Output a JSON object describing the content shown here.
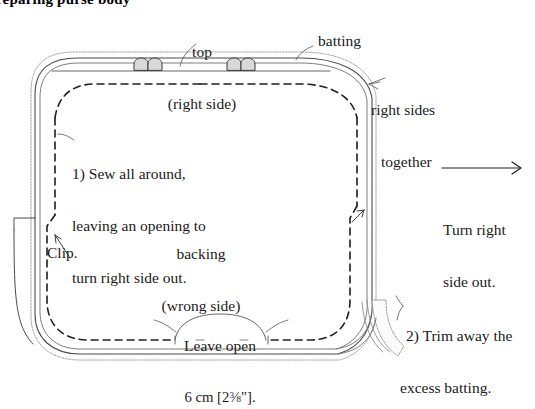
{
  "title": {
    "text": "reparing purse body",
    "note": "cropped heading at top edge"
  },
  "labels": {
    "top_line1": "top",
    "top_line2": "(right side)",
    "batting": "batting",
    "right_sides_1": "right sides",
    "right_sides_2": "together",
    "step1_line1": "1) Sew all around,",
    "step1_line2": "leaving an opening to",
    "step1_line3": "turn right side out.",
    "clip": "Clip.",
    "backing_line1": "backing",
    "backing_line2": "(wrong side)",
    "leave_open": "Leave open",
    "measure_cm": "6 cm [2",
    "measure_num": "3",
    "measure_den": "8",
    "measure_tail": "\"].",
    "turn_line1": "Turn right",
    "turn_line2": "side out.",
    "step2_line1": "2) Trim away the",
    "step2_line2": "excess batting."
  },
  "icons": {
    "arrow": "turn-arrow-icon",
    "leader": "leader-line-icon",
    "tab": "tab-loop-icon",
    "batting_edge": "wavy-batting-edge-icon",
    "stitch": "dashed-stitch-line-icon",
    "bracket": "opening-bracket-icon"
  },
  "colors": {
    "ink": "#1a1a1a",
    "line": "#3a3a3a",
    "light_line": "#8e8e8e",
    "batting": "#a8a8a8",
    "paper": "#ffffff"
  },
  "diagram": {
    "type": "sewing-instruction-line-drawing",
    "shape": "rounded-rectangle-purse-body",
    "tab_count": 2,
    "clip_notches": 2,
    "opening_on": "bottom-edge"
  }
}
